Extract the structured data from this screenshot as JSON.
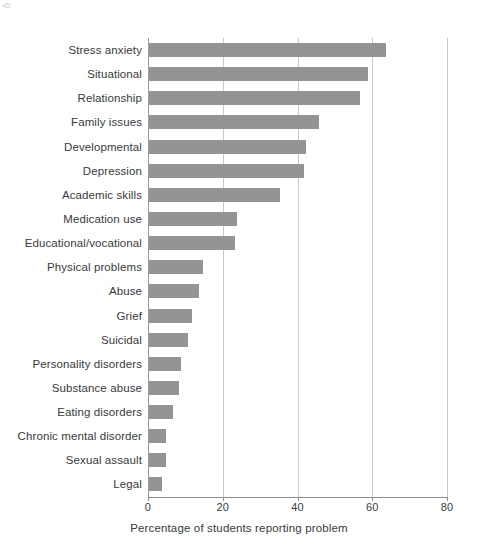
{
  "page_artifact": "45",
  "chart_data": {
    "type": "bar",
    "orientation": "horizontal",
    "title": "",
    "subtitle": "",
    "xlabel": "Percentage of students reporting problem",
    "ylabel": "",
    "xlim": [
      0,
      80
    ],
    "xticks": [
      0,
      20,
      40,
      60,
      80
    ],
    "xtick_labels": [
      "0",
      "20",
      "40",
      "60",
      "80"
    ],
    "grid": "vertical",
    "legend": "none",
    "bar_color": "#949494",
    "categories": [
      "Stress anxiety",
      "Situational",
      "Relationship",
      "Family issues",
      "Developmental",
      "Depression",
      "Academic skills",
      "Medication use",
      "Educational/vocational",
      "Physical problems",
      "Abuse",
      "Grief",
      "Suicidal",
      "Personality disorders",
      "Substance abuse",
      "Eating disorders",
      "Chronic mental disorder",
      "Sexual assault",
      "Legal"
    ],
    "values": [
      63.5,
      58.5,
      56.5,
      45.5,
      42.0,
      41.5,
      35.0,
      23.5,
      23.0,
      14.5,
      13.5,
      11.5,
      10.5,
      8.5,
      8.0,
      6.5,
      4.5,
      4.5,
      3.5
    ]
  }
}
